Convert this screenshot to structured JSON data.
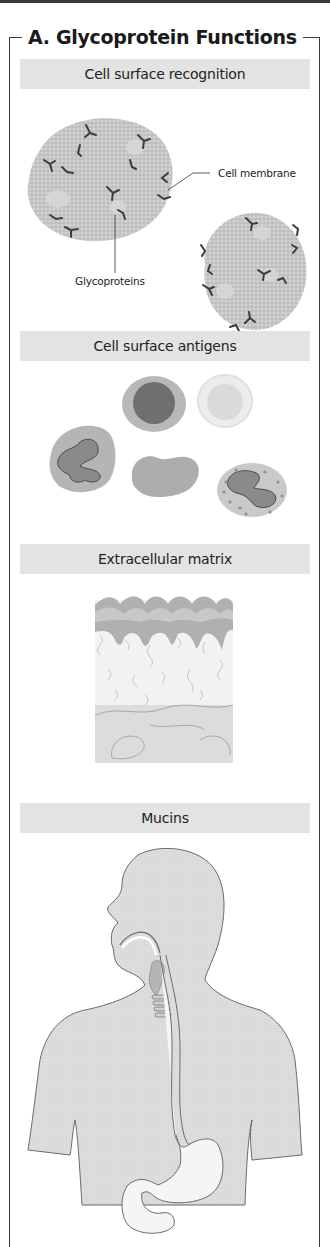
{
  "figure": {
    "title": "A. Glycoprotein Functions",
    "panels": [
      {
        "heading": "Cell surface recognition",
        "labels": {
          "membrane": "Cell membrane",
          "glycoproteins": "Glycoproteins"
        }
      },
      {
        "heading": "Cell surface antigens"
      },
      {
        "heading": "Extracellular matrix"
      },
      {
        "heading": "Mucins"
      }
    ]
  },
  "colors": {
    "frame": "#3a3a3a",
    "band": "#e3e3e3",
    "cell": "#c4c4c4",
    "glycoprotein": "#3c3c3c",
    "body_fill": "#dcdcdc",
    "tract_fill": "#f4f4f4"
  }
}
